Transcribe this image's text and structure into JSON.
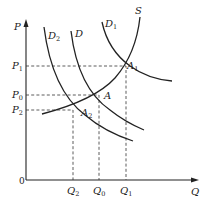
{
  "diagram": {
    "type": "supply-demand",
    "axes": {
      "y_label": "P",
      "x_label": "Q",
      "origin_label": "0"
    },
    "curves": [
      {
        "id": "S",
        "label": "S",
        "kind": "supply"
      },
      {
        "id": "D",
        "label": "D",
        "kind": "demand"
      },
      {
        "id": "D1",
        "label": "D",
        "subscript": "1",
        "kind": "demand"
      },
      {
        "id": "D2",
        "label": "D",
        "subscript": "2",
        "kind": "demand"
      }
    ],
    "points": [
      {
        "id": "A1",
        "label": "A",
        "subscript": "1"
      },
      {
        "id": "A",
        "label": "A",
        "subscript": ""
      },
      {
        "id": "A2",
        "label": "A",
        "subscript": "2"
      }
    ],
    "price_ticks": [
      {
        "label": "P",
        "subscript": "1"
      },
      {
        "label": "P",
        "subscript": "0"
      },
      {
        "label": "P",
        "subscript": "2"
      }
    ],
    "quantity_ticks": [
      {
        "label": "Q",
        "subscript": "2"
      },
      {
        "label": "Q",
        "subscript": "0"
      },
      {
        "label": "Q",
        "subscript": "1"
      }
    ]
  }
}
